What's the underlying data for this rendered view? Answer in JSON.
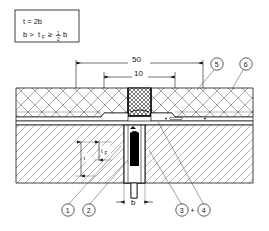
{
  "drawing": {
    "title": "expansion-joint-cross-section",
    "formula_box": {
      "line1": "t = 2b",
      "line2_a": "b >",
      "line2_b": "t",
      "line2_sub": "F",
      "line2_c": "≥",
      "line2_frac_num": "1",
      "line2_frac_den": "2",
      "line2_d": "b"
    },
    "dimensions": {
      "outer_width": "50",
      "inner_width": "10",
      "bottom_width": "b",
      "vertical_thickness": "t",
      "vertical_flange": "t",
      "vertical_flange_sub": "F"
    },
    "callouts": [
      {
        "id": "1",
        "label": "1"
      },
      {
        "id": "2",
        "label": "2"
      },
      {
        "id": "3",
        "label": "3"
      },
      {
        "id": "plus",
        "label": "+"
      },
      {
        "id": "4",
        "label": "4"
      },
      {
        "id": "5",
        "label": "5"
      },
      {
        "id": "6",
        "label": "6"
      }
    ],
    "colors": {
      "line": "#111111",
      "hatch": "#555555",
      "fill_dark": "#000000",
      "background": "#ffffff"
    }
  }
}
